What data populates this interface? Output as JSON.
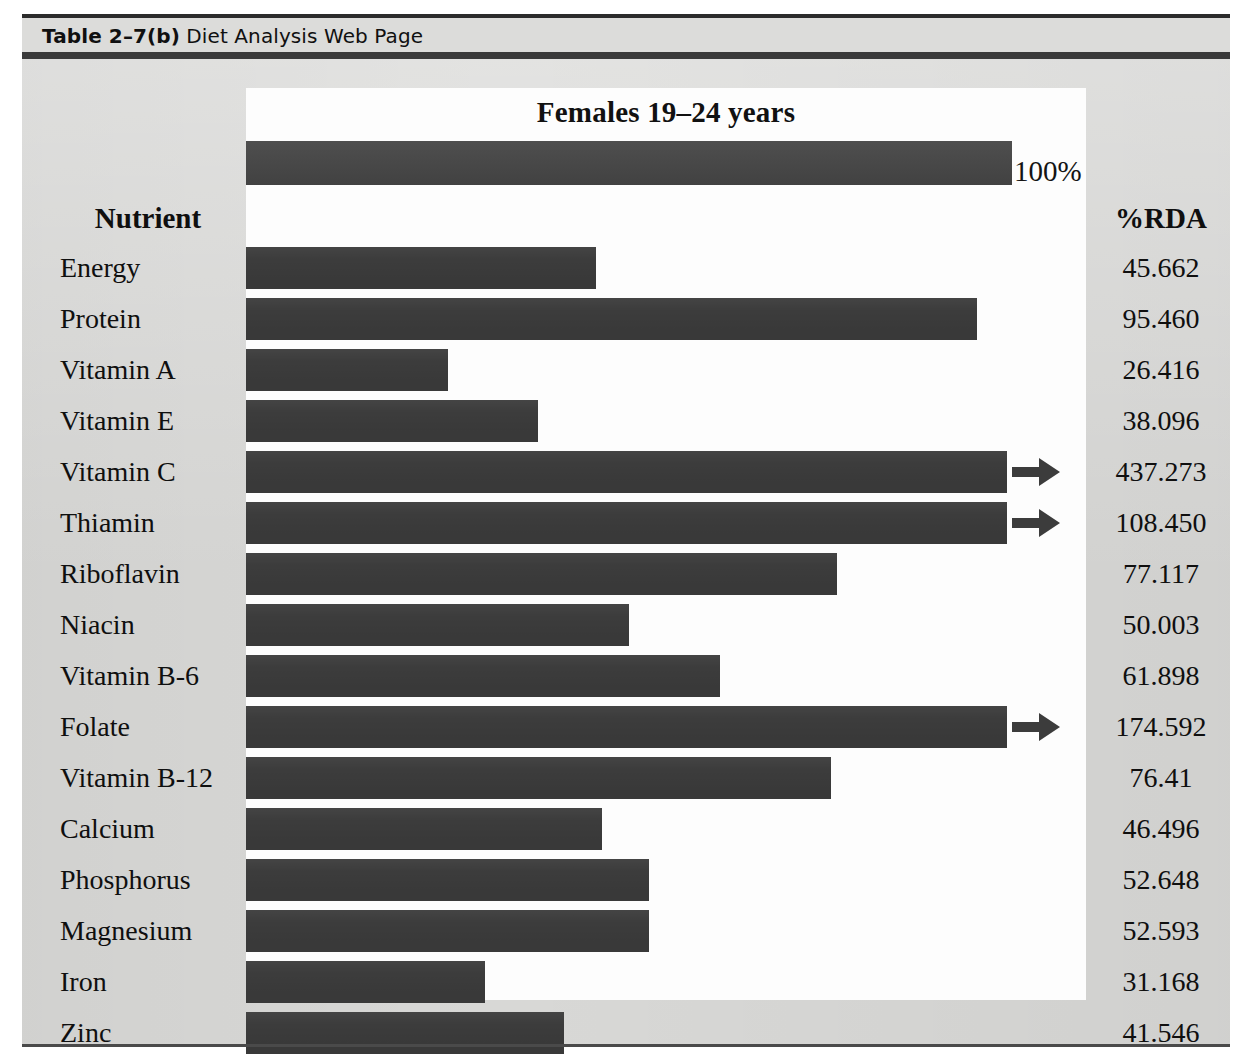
{
  "caption": {
    "number": "Table 2–7(b)",
    "title": "Diet Analysis Web Page"
  },
  "chart_data": {
    "type": "bar",
    "orientation": "horizontal",
    "title": "Females 19–24 years",
    "xlabel": "",
    "ylabel": "",
    "reference_label": "100%",
    "reference_value": 100,
    "xlim": [
      0,
      100
    ],
    "grid": false,
    "legend": null,
    "columns": [
      "Nutrient",
      "%RDA"
    ],
    "categories": [
      "Energy",
      "Protein",
      "Vitamin A",
      "Vitamin E",
      "Vitamin C",
      "Thiamin",
      "Riboflavin",
      "Niacin",
      "Vitamin B-6",
      "Folate",
      "Vitamin B-12",
      "Calcium",
      "Phosphorus",
      "Magnesium",
      "Iron",
      "Zinc"
    ],
    "values": [
      45.662,
      95.46,
      26.416,
      38.096,
      437.273,
      108.45,
      77.117,
      50.003,
      61.898,
      174.592,
      76.41,
      46.496,
      52.648,
      52.593,
      31.168,
      41.546
    ],
    "value_labels": [
      "45.662",
      "95.460",
      "26.416",
      "38.096",
      "437.273",
      "108.450",
      "77.117",
      "50.003",
      "61.898",
      "174.592",
      "76.41",
      "46.496",
      "52.648",
      "52.593",
      "52.593",
      "41.546"
    ],
    "rows": [
      {
        "nutrient": "Energy",
        "value_label": "45.662",
        "value": 45.662,
        "bar_pct": 45.662,
        "overflow": false
      },
      {
        "nutrient": "Protein",
        "value_label": "95.460",
        "value": 95.46,
        "bar_pct": 95.46,
        "overflow": false
      },
      {
        "nutrient": "Vitamin A",
        "value_label": "26.416",
        "value": 26.416,
        "bar_pct": 26.416,
        "overflow": false
      },
      {
        "nutrient": "Vitamin E",
        "value_label": "38.096",
        "value": 38.096,
        "bar_pct": 38.096,
        "overflow": false
      },
      {
        "nutrient": "Vitamin C",
        "value_label": "437.273",
        "value": 437.273,
        "bar_pct": 99.3,
        "overflow": true
      },
      {
        "nutrient": "Thiamin",
        "value_label": "108.450",
        "value": 108.45,
        "bar_pct": 99.3,
        "overflow": true
      },
      {
        "nutrient": "Riboflavin",
        "value_label": "77.117",
        "value": 77.117,
        "bar_pct": 77.117,
        "overflow": false
      },
      {
        "nutrient": "Niacin",
        "value_label": "50.003",
        "value": 50.003,
        "bar_pct": 50.003,
        "overflow": false
      },
      {
        "nutrient": "Vitamin B-6",
        "value_label": "61.898",
        "value": 61.898,
        "bar_pct": 61.898,
        "overflow": false
      },
      {
        "nutrient": "Folate",
        "value_label": "174.592",
        "value": 174.592,
        "bar_pct": 99.3,
        "overflow": true
      },
      {
        "nutrient": "Vitamin B-12",
        "value_label": "76.41",
        "value": 76.41,
        "bar_pct": 76.41,
        "overflow": false
      },
      {
        "nutrient": "Calcium",
        "value_label": "46.496",
        "value": 46.496,
        "bar_pct": 46.496,
        "overflow": false
      },
      {
        "nutrient": "Phosphorus",
        "value_label": "52.648",
        "value": 52.648,
        "bar_pct": 52.648,
        "overflow": false
      },
      {
        "nutrient": "Magnesium",
        "value_label": "52.593",
        "value": 52.593,
        "bar_pct": 52.593,
        "overflow": false
      },
      {
        "nutrient": "Iron",
        "value_label": "31.168",
        "value": 31.168,
        "bar_pct": 31.168,
        "overflow": false
      },
      {
        "nutrient": "Zinc",
        "value_label": "41.546",
        "value": 41.546,
        "bar_pct": 41.546,
        "overflow": false
      }
    ]
  },
  "colors": {
    "bar": "#3c3c3c",
    "reference_bar": "#454545",
    "panel": "#d8d8d6",
    "plate": "#fdfdfd",
    "rule": "#2b2b2b",
    "text": "#0f0f0f"
  }
}
